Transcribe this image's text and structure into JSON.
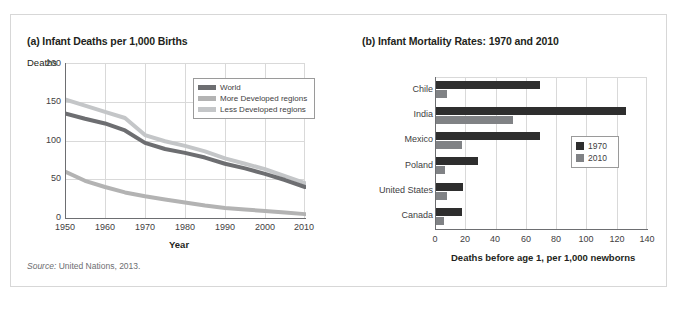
{
  "source_note": {
    "label": "Source:",
    "text": " United Nations, 2013."
  },
  "panel_a": {
    "title": "(a) Infant Deaths per 1,000 Births",
    "y_axis_label": "Deaths",
    "x_axis_title": "Year"
  },
  "panel_b": {
    "title": "(b) Infant Mortality Rates: 1970 and 2010",
    "x_axis_title": "Deaths before age 1, per 1,000 newborns"
  },
  "colors": {
    "world": "#6d6e71",
    "more_developed": "#b3b3b3",
    "less_developed": "#a7a9ac",
    "bar_1970": "#2e2e2e",
    "bar_2010": "#808285",
    "grid": "#d9d9d9",
    "axis": "#6d6e71",
    "panel_border": "#d7d7d7"
  },
  "chart_data": [
    {
      "id": "infant-deaths-line",
      "type": "line",
      "title": "(a) Infant Deaths per 1,000 Births",
      "xlabel": "Year",
      "ylabel": "Deaths",
      "xlim": [
        1950,
        2010
      ],
      "ylim": [
        0,
        200
      ],
      "xticks": [
        1950,
        1960,
        1970,
        1980,
        1990,
        2000,
        2010
      ],
      "yticks": [
        0,
        50,
        100,
        150,
        200
      ],
      "grid": true,
      "legend_position": "top-right",
      "x": [
        1950,
        1955,
        1960,
        1965,
        1970,
        1975,
        1980,
        1985,
        1990,
        1995,
        2000,
        2005,
        2010
      ],
      "series": [
        {
          "name": "World",
          "color": "#6d6e71",
          "values": [
            135,
            128,
            122,
            113,
            97,
            89,
            84,
            78,
            70,
            64,
            57,
            49,
            40
          ]
        },
        {
          "name": "More Developed regions",
          "color": "#b3b3b3",
          "values": [
            60,
            48,
            40,
            33,
            28,
            24,
            20,
            16,
            13,
            11,
            9,
            7,
            5
          ]
        },
        {
          "name": "Less Developed regions",
          "color": "#a7a9ac",
          "values": [
            153,
            145,
            137,
            129,
            107,
            99,
            93,
            86,
            77,
            70,
            63,
            54,
            45
          ]
        }
      ]
    },
    {
      "id": "infant-mortality-bars",
      "type": "bar",
      "orientation": "horizontal",
      "title": "(b) Infant Mortality Rates: 1970 and 2010",
      "xlabel": "Deaths before age 1, per 1,000 newborns",
      "ylabel": "",
      "xlim": [
        0,
        140
      ],
      "xticks": [
        0,
        20,
        40,
        60,
        80,
        100,
        120,
        140
      ],
      "grid": true,
      "legend_position": "right",
      "categories": [
        "Chile",
        "India",
        "Mexico",
        "Poland",
        "United States",
        "Canada"
      ],
      "series": [
        {
          "name": "1970",
          "color": "#2e2e2e",
          "values": [
            69,
            126,
            69,
            28,
            18,
            17
          ]
        },
        {
          "name": "2010",
          "color": "#808285",
          "values": [
            7,
            51,
            17,
            6,
            7,
            5
          ]
        }
      ]
    }
  ]
}
